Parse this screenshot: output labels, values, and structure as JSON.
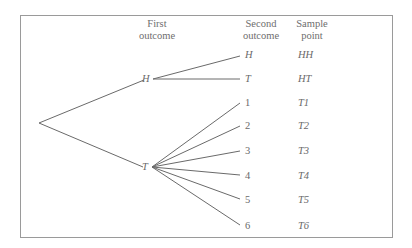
{
  "headers": {
    "first_outcome": "First\noutcome",
    "second_outcome": "Second\noutcome",
    "sample_point": "Sample\npoint"
  },
  "first_level": [
    {
      "label": "H"
    },
    {
      "label": "T"
    }
  ],
  "second_level": [
    {
      "parent": "H",
      "label": "H",
      "sample_point": "HH"
    },
    {
      "parent": "H",
      "label": "T",
      "sample_point": "HT"
    },
    {
      "parent": "T",
      "label": "1",
      "sample_point": "T1"
    },
    {
      "parent": "T",
      "label": "2",
      "sample_point": "T2"
    },
    {
      "parent": "T",
      "label": "3",
      "sample_point": "T3"
    },
    {
      "parent": "T",
      "label": "4",
      "sample_point": "T4"
    },
    {
      "parent": "T",
      "label": "5",
      "sample_point": "T5"
    },
    {
      "parent": "T",
      "label": "6",
      "sample_point": "T6"
    }
  ],
  "colors": {
    "line": "#6a6a6a",
    "frame": "#9a9a9a",
    "text": "#6a6a6a"
  }
}
